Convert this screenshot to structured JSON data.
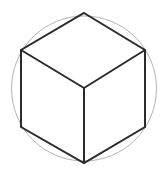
{
  "figure": {
    "canvas": {
      "width": 163,
      "height": 178,
      "background": "#ffffff"
    },
    "colors": {
      "cube_stroke": "#2b2b2b",
      "circle_stroke": "#b4b4b4",
      "background": "#ffffff"
    },
    "stroke_widths": {
      "cube": 2,
      "circle": 1
    },
    "circle": {
      "name": "circumscribed-circle",
      "cx": 84,
      "cy": 88.5,
      "r": 72.5,
      "fill": "none"
    },
    "cube": {
      "name": "isometric-cube",
      "center_vertex": {
        "label": "center",
        "x": 84,
        "y": 88
      },
      "outline_points": "84,13 145,50 145,127 84,163 21,127 21,50",
      "vertices": [
        {
          "label": "top",
          "x": 84,
          "y": 13
        },
        {
          "label": "upper-right",
          "x": 145,
          "y": 50
        },
        {
          "label": "lower-right",
          "x": 145,
          "y": 127
        },
        {
          "label": "bottom",
          "x": 84,
          "y": 163
        },
        {
          "label": "lower-left",
          "x": 21,
          "y": 127
        },
        {
          "label": "upper-left",
          "x": 21,
          "y": 50
        }
      ],
      "spokes": [
        {
          "label": "spoke-to-upper-left",
          "x1": 84,
          "y1": 88,
          "x2": 21,
          "y2": 50
        },
        {
          "label": "spoke-to-upper-right",
          "x1": 84,
          "y1": 88,
          "x2": 145,
          "y2": 50
        },
        {
          "label": "spoke-to-bottom",
          "x1": 84,
          "y1": 88,
          "x2": 84,
          "y2": 163
        }
      ]
    }
  }
}
